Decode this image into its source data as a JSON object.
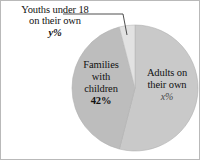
{
  "figure": {
    "background": "#ffffff",
    "border_color": "#b9b9b9"
  },
  "callout": {
    "line1": "Youths under 18",
    "line2": "on their own",
    "percent": "y%"
  },
  "slices": {
    "families": {
      "line1": "Families",
      "line2": "with",
      "line3": "children",
      "percent": "42%"
    },
    "adults": {
      "line1": "Adults on",
      "line2": "their own",
      "percent": "x%"
    }
  },
  "chart_data": {
    "type": "pie",
    "title": "",
    "labels": [
      "Adults on their own",
      "Families with children",
      "Youths under 18 on their own"
    ],
    "value_labels": [
      "x%",
      "42%",
      "y%"
    ],
    "values": [
      54,
      42,
      4
    ],
    "colors": [
      "#c9c9c9",
      "#bdbdbd",
      "#e2e2e2"
    ],
    "stroke_color": "#aaaaaa",
    "legend": "none",
    "center": [
      134,
      87
    ],
    "radius": 63,
    "start_angle_deg": 0,
    "annotations": [
      {
        "text": "Youths under 18 on their own y%",
        "target_slice": "Youths under 18 on their own",
        "style": "leader-line"
      }
    ]
  }
}
